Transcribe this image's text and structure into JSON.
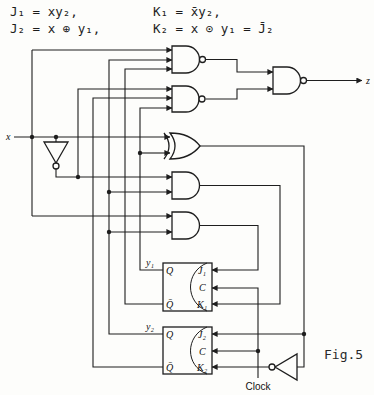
{
  "equations": {
    "j1": "J₁ = xy₂,",
    "k1": "K₁ = x̄y₂,",
    "j2": "J₂ = x ⊕ y₁,",
    "k2": "K₂ = x ⊙ y₁ = J̄₂"
  },
  "circuit": {
    "input_label": "x",
    "output_label": "z",
    "clock_label": "Clock",
    "gates": [
      {
        "id": "nand-1",
        "type": "NAND",
        "inputs": [
          "x",
          "y₂",
          "ȳ₁"
        ]
      },
      {
        "id": "nand-2",
        "type": "NAND",
        "inputs": [
          "x̄",
          "ȳ₂",
          "y₁"
        ]
      },
      {
        "id": "nand-out",
        "type": "NAND",
        "inputs": [
          "nand-1",
          "nand-2"
        ],
        "output": "z"
      },
      {
        "id": "xor",
        "type": "XOR",
        "inputs": [
          "x",
          "y₁"
        ],
        "drives": [
          "J₂",
          "inverter → K₂"
        ]
      },
      {
        "id": "and-k1",
        "type": "AND",
        "inputs": [
          "x̄",
          "y₂"
        ],
        "drives": "K₁"
      },
      {
        "id": "and-j1",
        "type": "AND",
        "inputs": [
          "x",
          "y₂"
        ],
        "drives": "J₁"
      },
      {
        "id": "inv-x",
        "type": "NOT",
        "inputs": [
          "x"
        ]
      },
      {
        "id": "inv-k2",
        "type": "NOT",
        "inputs": [
          "xor"
        ],
        "drives": "K₂"
      }
    ],
    "flip_flops": [
      {
        "output_label": "y₁",
        "pins": {
          "q": "Q",
          "q_bar": "Q̄",
          "j": "J₁",
          "c": "C",
          "k": "K₁"
        }
      },
      {
        "output_label": "y₂",
        "pins": {
          "q": "Q",
          "q_bar": "Q̄",
          "j": "J₂",
          "c": "C",
          "k": "K₂"
        }
      }
    ]
  },
  "figure_label": "Fig.5"
}
